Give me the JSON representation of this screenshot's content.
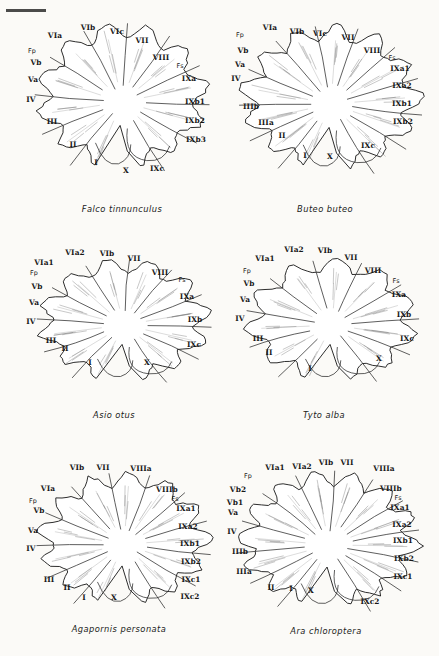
{
  "figure": {
    "kind": "comparative-anatomy-plate",
    "panel_count": 6,
    "scale_bar": true,
    "abbreviations": {
      "Fp": "fissura prima",
      "Fs": "fissura secunda"
    },
    "colors": {
      "ink": "#151515",
      "paper": "#fbfaf7",
      "granular": "#6e6e6e",
      "medullary": "#909090"
    }
  },
  "panels": [
    {
      "id": "falco-tinnunculus",
      "species": "Falco tinnunculus",
      "labels": [
        {
          "text": "VIb",
          "x": 74,
          "y": 20,
          "cls": "rm"
        },
        {
          "text": "VIc",
          "x": 103,
          "y": 24,
          "cls": "rm"
        },
        {
          "text": "VIa",
          "x": 41,
          "y": 28,
          "cls": "rm"
        },
        {
          "text": "VII",
          "x": 128,
          "y": 33,
          "cls": "rm"
        },
        {
          "text": "Fp",
          "x": 18,
          "y": 43,
          "cls": "fs"
        },
        {
          "text": "VIII",
          "x": 147,
          "y": 50,
          "cls": "rm"
        },
        {
          "text": "Fs",
          "x": 166,
          "y": 58,
          "cls": "fs"
        },
        {
          "text": "Vb",
          "x": 22,
          "y": 55,
          "cls": "rm"
        },
        {
          "text": "Va",
          "x": 19,
          "y": 72,
          "cls": "rm"
        },
        {
          "text": "IXa",
          "x": 175,
          "y": 71,
          "cls": "rm"
        },
        {
          "text": "IV",
          "x": 17,
          "y": 92,
          "cls": "rm"
        },
        {
          "text": "IXb1",
          "x": 181,
          "y": 94,
          "cls": "rm"
        },
        {
          "text": "IXb2",
          "x": 181,
          "y": 113,
          "cls": "rm"
        },
        {
          "text": "III",
          "x": 38,
          "y": 114,
          "cls": "rm"
        },
        {
          "text": "IXb3",
          "x": 182,
          "y": 132,
          "cls": "rm"
        },
        {
          "text": "II",
          "x": 59,
          "y": 137,
          "cls": "rm"
        },
        {
          "text": "I",
          "x": 82,
          "y": 155,
          "cls": "rm"
        },
        {
          "text": "X",
          "x": 112,
          "y": 163,
          "cls": "rm"
        },
        {
          "text": "IXc",
          "x": 143,
          "y": 161,
          "cls": "rm"
        }
      ]
    },
    {
      "id": "buteo-buteo",
      "species": "Buteo buteo",
      "labels": [
        {
          "text": "VIa",
          "x": 50,
          "y": 20,
          "cls": "rm"
        },
        {
          "text": "VIb",
          "x": 77,
          "y": 24,
          "cls": "rm"
        },
        {
          "text": "VIc",
          "x": 100,
          "y": 26,
          "cls": "rm"
        },
        {
          "text": "Fp",
          "x": 20,
          "y": 27,
          "cls": "fs"
        },
        {
          "text": "VII",
          "x": 128,
          "y": 30,
          "cls": "rm"
        },
        {
          "text": "Vb",
          "x": 23,
          "y": 43,
          "cls": "rm"
        },
        {
          "text": "VIII",
          "x": 152,
          "y": 43,
          "cls": "rm"
        },
        {
          "text": "Fs",
          "x": 172,
          "y": 50,
          "cls": "fs"
        },
        {
          "text": "Va",
          "x": 20,
          "y": 57,
          "cls": "rm"
        },
        {
          "text": "IXa1",
          "x": 180,
          "y": 61,
          "cls": "rm"
        },
        {
          "text": "IV",
          "x": 16,
          "y": 71,
          "cls": "rm"
        },
        {
          "text": "IXa2",
          "x": 182,
          "y": 78,
          "cls": "rm"
        },
        {
          "text": "IXb1",
          "x": 182,
          "y": 96,
          "cls": "rm"
        },
        {
          "text": "IIIb",
          "x": 31,
          "y": 99,
          "cls": "rm"
        },
        {
          "text": "IXb2",
          "x": 183,
          "y": 114,
          "cls": "rm"
        },
        {
          "text": "IIIa",
          "x": 46,
          "y": 115,
          "cls": "rm"
        },
        {
          "text": "II",
          "x": 62,
          "y": 128,
          "cls": "rm"
        },
        {
          "text": "IXc",
          "x": 148,
          "y": 138,
          "cls": "rm"
        },
        {
          "text": "I",
          "x": 85,
          "y": 148,
          "cls": "rm"
        },
        {
          "text": "X",
          "x": 110,
          "y": 149,
          "cls": "rm"
        }
      ]
    },
    {
      "id": "asio-otus",
      "species": "Asio otus",
      "labels": [
        {
          "text": "VIa2",
          "x": 61,
          "y": 21,
          "cls": "rm"
        },
        {
          "text": "VIb",
          "x": 93,
          "y": 22,
          "cls": "rm"
        },
        {
          "text": "VII",
          "x": 120,
          "y": 27,
          "cls": "rm"
        },
        {
          "text": "VIa1",
          "x": 30,
          "y": 31,
          "cls": "rm"
        },
        {
          "text": "Fp",
          "x": 20,
          "y": 41,
          "cls": "fs"
        },
        {
          "text": "VIII",
          "x": 146,
          "y": 41,
          "cls": "rm"
        },
        {
          "text": "Fs",
          "x": 168,
          "y": 48,
          "cls": "fs"
        },
        {
          "text": "Vb",
          "x": 23,
          "y": 55,
          "cls": "rm"
        },
        {
          "text": "IXa",
          "x": 173,
          "y": 65,
          "cls": "rm"
        },
        {
          "text": "Va",
          "x": 20,
          "y": 71,
          "cls": "rm"
        },
        {
          "text": "IV",
          "x": 17,
          "y": 90,
          "cls": "rm"
        },
        {
          "text": "IXb",
          "x": 181,
          "y": 88,
          "cls": "rm"
        },
        {
          "text": "III",
          "x": 37,
          "y": 109,
          "cls": "rm"
        },
        {
          "text": "II",
          "x": 51,
          "y": 117,
          "cls": "rm"
        },
        {
          "text": "IXc",
          "x": 180,
          "y": 113,
          "cls": "rm"
        },
        {
          "text": "I",
          "x": 76,
          "y": 131,
          "cls": "rm"
        },
        {
          "text": "X",
          "x": 133,
          "y": 131,
          "cls": "rm"
        }
      ]
    },
    {
      "id": "tyto-alba",
      "species": "Tyto alba",
      "labels": [
        {
          "text": "VIa2",
          "x": 70,
          "y": 18,
          "cls": "rm"
        },
        {
          "text": "VIb",
          "x": 101,
          "y": 19,
          "cls": "rm"
        },
        {
          "text": "VIa1",
          "x": 41,
          "y": 27,
          "cls": "rm"
        },
        {
          "text": "VII",
          "x": 127,
          "y": 26,
          "cls": "rm"
        },
        {
          "text": "Fp",
          "x": 23,
          "y": 39,
          "cls": "fs"
        },
        {
          "text": "VIII",
          "x": 149,
          "y": 39,
          "cls": "rm"
        },
        {
          "text": "Fs",
          "x": 172,
          "y": 49,
          "cls": "fs"
        },
        {
          "text": "Vb",
          "x": 25,
          "y": 52,
          "cls": "rm"
        },
        {
          "text": "IXa",
          "x": 175,
          "y": 63,
          "cls": "rm"
        },
        {
          "text": "Va",
          "x": 21,
          "y": 68,
          "cls": "rm"
        },
        {
          "text": "IXb",
          "x": 180,
          "y": 83,
          "cls": "rm"
        },
        {
          "text": "IV",
          "x": 16,
          "y": 87,
          "cls": "rm"
        },
        {
          "text": "IXc",
          "x": 183,
          "y": 107,
          "cls": "rm"
        },
        {
          "text": "III",
          "x": 34,
          "y": 107,
          "cls": "rm"
        },
        {
          "text": "II",
          "x": 45,
          "y": 121,
          "cls": "rm"
        },
        {
          "text": "X",
          "x": 155,
          "y": 127,
          "cls": "rm"
        },
        {
          "text": "I",
          "x": 86,
          "y": 137,
          "cls": "rm"
        }
      ]
    },
    {
      "id": "agapornis-personata",
      "species": "Agapornis personata",
      "labels": [
        {
          "text": "VIb",
          "x": 63,
          "y": 16,
          "cls": "rm"
        },
        {
          "text": "VII",
          "x": 89,
          "y": 16,
          "cls": "rm"
        },
        {
          "text": "VIIIa",
          "x": 127,
          "y": 17,
          "cls": "rm"
        },
        {
          "text": "VIa",
          "x": 34,
          "y": 37,
          "cls": "rm"
        },
        {
          "text": "VIIIb",
          "x": 153,
          "y": 38,
          "cls": "rm"
        },
        {
          "text": "Fs",
          "x": 161,
          "y": 47,
          "cls": "fs"
        },
        {
          "text": "Fp",
          "x": 19,
          "y": 49,
          "cls": "fs"
        },
        {
          "text": "Vb",
          "x": 25,
          "y": 59,
          "cls": "rm"
        },
        {
          "text": "IXa1",
          "x": 172,
          "y": 57,
          "cls": "rm"
        },
        {
          "text": "IXa2",
          "x": 174,
          "y": 75,
          "cls": "rm"
        },
        {
          "text": "Va",
          "x": 19,
          "y": 79,
          "cls": "rm"
        },
        {
          "text": "IXb1",
          "x": 176,
          "y": 92,
          "cls": "rm"
        },
        {
          "text": "IV",
          "x": 17,
          "y": 97,
          "cls": "rm"
        },
        {
          "text": "IXb2",
          "x": 177,
          "y": 110,
          "cls": "rm"
        },
        {
          "text": "IXc1",
          "x": 177,
          "y": 128,
          "cls": "rm"
        },
        {
          "text": "III",
          "x": 35,
          "y": 128,
          "cls": "rm"
        },
        {
          "text": "II",
          "x": 53,
          "y": 136,
          "cls": "rm"
        },
        {
          "text": "IXc2",
          "x": 176,
          "y": 145,
          "cls": "rm"
        },
        {
          "text": "I",
          "x": 70,
          "y": 146,
          "cls": "rm"
        },
        {
          "text": "X",
          "x": 100,
          "y": 146,
          "cls": "rm"
        }
      ]
    },
    {
      "id": "ara-chloroptera",
      "species": "Ara chloroptera",
      "labels": [
        {
          "text": "VIa1",
          "x": 57,
          "y": 20,
          "cls": "rm"
        },
        {
          "text": "VIa2",
          "x": 84,
          "y": 19,
          "cls": "rm"
        },
        {
          "text": "VIb",
          "x": 108,
          "y": 15,
          "cls": "rm"
        },
        {
          "text": "VII",
          "x": 129,
          "y": 15,
          "cls": "rm"
        },
        {
          "text": "VIIIa",
          "x": 166,
          "y": 21,
          "cls": "rm"
        },
        {
          "text": "Fp",
          "x": 30,
          "y": 28,
          "cls": "fs"
        },
        {
          "text": "Vb2",
          "x": 20,
          "y": 42,
          "cls": "rm"
        },
        {
          "text": "VIIIb",
          "x": 173,
          "y": 41,
          "cls": "rm"
        },
        {
          "text": "Fs",
          "x": 180,
          "y": 50,
          "cls": "fs"
        },
        {
          "text": "Vb1",
          "x": 17,
          "y": 55,
          "cls": "rm"
        },
        {
          "text": "IXa1",
          "x": 182,
          "y": 60,
          "cls": "rm"
        },
        {
          "text": "Va",
          "x": 15,
          "y": 65,
          "cls": "rm"
        },
        {
          "text": "IXa2",
          "x": 184,
          "y": 77,
          "cls": "rm"
        },
        {
          "text": "IV",
          "x": 14,
          "y": 84,
          "cls": "rm"
        },
        {
          "text": "IXb1",
          "x": 185,
          "y": 93,
          "cls": "rm"
        },
        {
          "text": "IIIb",
          "x": 22,
          "y": 104,
          "cls": "rm"
        },
        {
          "text": "IXb2",
          "x": 186,
          "y": 111,
          "cls": "rm"
        },
        {
          "text": "IIIa",
          "x": 26,
          "y": 124,
          "cls": "rm"
        },
        {
          "text": "IXc1",
          "x": 185,
          "y": 129,
          "cls": "rm"
        },
        {
          "text": "II",
          "x": 53,
          "y": 140,
          "cls": "rm"
        },
        {
          "text": "I",
          "x": 73,
          "y": 141,
          "cls": "rm"
        },
        {
          "text": "X",
          "x": 93,
          "y": 143,
          "cls": "rm"
        },
        {
          "text": "IXc2",
          "x": 152,
          "y": 154,
          "cls": "rm"
        }
      ]
    }
  ]
}
